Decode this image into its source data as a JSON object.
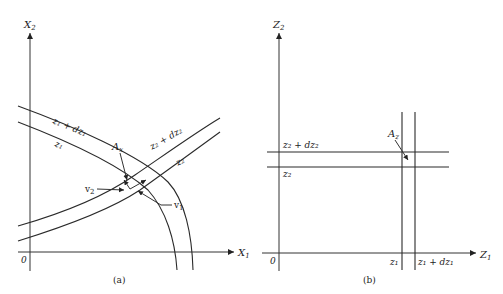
{
  "panel_a": {
    "caption": "(a)",
    "origin_label": "0",
    "x_axis_label": "X",
    "x_axis_sub": "1",
    "y_axis_label": "X",
    "y_axis_sub": "2",
    "curves": [
      {
        "id": "z1_plus_dz1",
        "label": "z₁ + dz₁"
      },
      {
        "id": "z1",
        "label": "z₁"
      },
      {
        "id": "z2_plus_dz2",
        "label": "z₂ + dz₂"
      },
      {
        "id": "z2",
        "label": "z₂"
      }
    ],
    "area_label": "A",
    "area_sub": "x",
    "vector_labels": [
      {
        "id": "v2",
        "label": "v",
        "sub": "2"
      },
      {
        "id": "v1",
        "label": "v",
        "sub": "1"
      }
    ]
  },
  "panel_b": {
    "caption": "(b)",
    "origin_label": "0",
    "x_axis_label": "Z",
    "x_axis_sub": "1",
    "y_axis_label": "Z",
    "y_axis_sub": "2",
    "horizontal_lines": [
      {
        "id": "z2_plus_dz2",
        "label": "z₂ + dz₂"
      },
      {
        "id": "z2",
        "label": "z₂"
      }
    ],
    "vertical_lines": [
      {
        "id": "z1",
        "label": "z₁"
      },
      {
        "id": "z1_plus_dz1",
        "label": "z₁ + dz₁"
      }
    ],
    "area_label": "A",
    "area_sub": "z"
  },
  "colors": {
    "line": "#2a2a2a",
    "background": "#ffffff"
  }
}
